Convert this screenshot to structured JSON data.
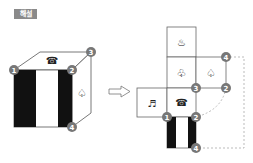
{
  "header": {
    "label": "해설"
  },
  "colors": {
    "badge_bg": "#8a8a8a",
    "badge_circle": "#777777",
    "line": "#555555",
    "dotted": "#aaaaaa",
    "black_bar": "#111111"
  },
  "cube": {
    "top_face_symbol": "☎",
    "right_face_symbol": "♤",
    "front_face": "black-white-black vertical stripes",
    "corner_labels": {
      "c1": "1",
      "c2": "2",
      "c3": "3",
      "c4": "4"
    }
  },
  "arrow": {
    "symbol": "⇨"
  },
  "net": {
    "cells": {
      "top": "♨",
      "middle": "♧",
      "right": "♤",
      "left": "♬",
      "center": "☎"
    },
    "corner_labels": {
      "top_right_4": "4",
      "mid_3": "3",
      "mid_right_2": "2",
      "bottom_1": "1",
      "bottom_2": "2",
      "bottom_4": "4"
    }
  }
}
